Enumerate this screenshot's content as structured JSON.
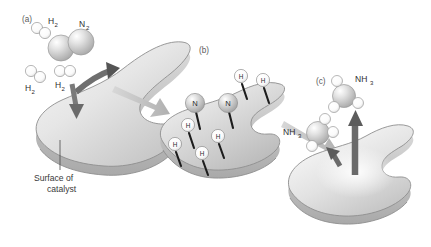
{
  "figure": {
    "background_color": "#ffffff",
    "panels": [
      {
        "id": "a",
        "label": "(a)",
        "caption": "Surface of catalyst",
        "caption_line1": "Surface of",
        "caption_line2": "catalyst",
        "description": "Hydrogen and nitrogen molecules approach and adsorb onto the catalyst surface",
        "molecules": [
          {
            "name": "H2",
            "label": "H",
            "subscript": "2",
            "atoms": 2,
            "kind": "hydrogen"
          },
          {
            "name": "N2",
            "label": "N",
            "subscript": "2",
            "atoms": 2,
            "kind": "nitrogen"
          },
          {
            "name": "H2",
            "label": "H",
            "subscript": "2",
            "atoms": 2,
            "kind": "hydrogen"
          },
          {
            "name": "H2",
            "label": "H",
            "subscript": "2",
            "atoms": 2,
            "kind": "hydrogen"
          }
        ]
      },
      {
        "id": "b",
        "label": "(b)",
        "caption": "",
        "description": "Adsorbed molecules dissociate into individual N and H atoms bonded to the surface",
        "adsorbed_atoms": [
          {
            "label": "N",
            "kind": "nitrogen"
          },
          {
            "label": "N",
            "kind": "nitrogen"
          },
          {
            "label": "H",
            "kind": "hydrogen"
          },
          {
            "label": "H",
            "kind": "hydrogen"
          },
          {
            "label": "H",
            "kind": "hydrogen"
          },
          {
            "label": "H",
            "kind": "hydrogen"
          },
          {
            "label": "H",
            "kind": "hydrogen"
          },
          {
            "label": "H",
            "kind": "hydrogen"
          }
        ],
        "nitrogen_count": 2,
        "hydrogen_count": 6
      },
      {
        "id": "c",
        "label": "(c)",
        "caption": "",
        "description": "Ammonia molecules form and desorb from the catalyst surface",
        "molecules": [
          {
            "name": "NH3",
            "label": "NH",
            "subscript": "3",
            "atoms": 4,
            "kind": "ammonia"
          },
          {
            "name": "NH3",
            "label": "NH",
            "subscript": "3",
            "atoms": 4,
            "kind": "ammonia"
          }
        ]
      }
    ],
    "labels": {
      "h2": "H",
      "h2_sub": "2",
      "n2": "N",
      "n2_sub": "2",
      "nh3": "NH",
      "nh3_sub": "3",
      "atom_n": "N",
      "atom_h": "H"
    },
    "arrows": [
      {
        "name": "adsorption-arrow-up",
        "style": "curved-dark",
        "direction": "up-right",
        "panel": "a"
      },
      {
        "name": "adsorption-arrow-down",
        "style": "straight-dark",
        "direction": "down",
        "panel": "a"
      },
      {
        "name": "step-arrow-a-to-b",
        "style": "block-gray",
        "direction": "right-down",
        "panel": "a-b"
      },
      {
        "name": "step-arrow-b-to-c",
        "style": "block-gray",
        "direction": "right-down",
        "panel": "b-c"
      },
      {
        "name": "desorption-arrow-up",
        "style": "straight-dark",
        "direction": "up",
        "panel": "c"
      },
      {
        "name": "desorption-arrow-small",
        "style": "straight-dark",
        "direction": "up-left",
        "panel": "c"
      }
    ],
    "colors": {
      "background": "#ffffff",
      "slab_light": "#f3f3f3",
      "slab_mid": "#d2d2d2",
      "slab_dark": "#a8a8a8",
      "slab_outline": "#8e8e8e",
      "arrow_dark": "#6f6f6f",
      "arrow_gray": "#c0c0c0",
      "bond_black": "#1c1c1c",
      "text": "#2e2e2e",
      "label_gray": "#5a5a5a",
      "atom_nitrogen": "#c9c9c9",
      "atom_hydrogen": "#fbfbfb"
    }
  }
}
